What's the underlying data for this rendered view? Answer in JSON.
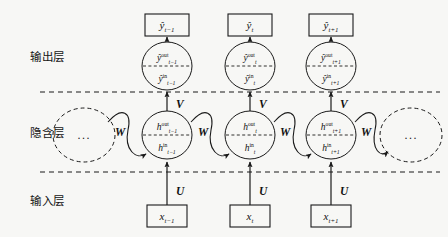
{
  "figure": {
    "type": "rnn-unfolded-architecture",
    "background": "#f7f7f5",
    "ink": "#1a1a1a"
  },
  "layers": [
    {
      "id": "output",
      "label": "输出层",
      "x": 30,
      "y": 48
    },
    {
      "id": "hidden",
      "label": "隐含层",
      "x": 30,
      "y": 124
    },
    {
      "id": "input",
      "label": "输入层",
      "x": 30,
      "y": 192
    }
  ],
  "dividers": [
    {
      "id": "output-hidden-divider",
      "y": 92,
      "x1": 40,
      "x2": 440
    },
    {
      "id": "hidden-input-divider",
      "y": 172,
      "x1": 40,
      "x2": 440
    }
  ],
  "timesteps": [
    {
      "id": "t-minus-1",
      "cx": 167,
      "output_box": {
        "base": "ŷ",
        "sub": "t−1"
      },
      "output_node": {
        "top": {
          "base": "ŷ",
          "sub": "t−1",
          "sup": "out"
        },
        "bottom": {
          "base": "ŷ",
          "sub": "t−1",
          "sup": "in"
        }
      },
      "hidden_node": {
        "top": {
          "base": "h",
          "sub": "t−1",
          "sup": "out"
        },
        "bottom": {
          "base": "h",
          "sub": "t−1",
          "sup": "in"
        }
      },
      "input_box": {
        "base": "x",
        "sub": "t−1"
      }
    },
    {
      "id": "t",
      "cx": 250,
      "output_box": {
        "base": "ŷ",
        "sub": "t"
      },
      "output_node": {
        "top": {
          "base": "ŷ",
          "sub": "t",
          "sup": "out"
        },
        "bottom": {
          "base": "ŷ",
          "sub": "t",
          "sup": "in"
        }
      },
      "hidden_node": {
        "top": {
          "base": "h",
          "sub": "t",
          "sup": "out"
        },
        "bottom": {
          "base": "h",
          "sub": "t",
          "sup": "in"
        }
      },
      "input_box": {
        "base": "x",
        "sub": "t"
      }
    },
    {
      "id": "t-plus-1",
      "cx": 331,
      "output_box": {
        "base": "ŷ",
        "sub": "t+1"
      },
      "output_node": {
        "top": {
          "base": "ŷ",
          "sub": "t+1",
          "sup": "out"
        },
        "bottom": {
          "base": "ŷ",
          "sub": "t+1",
          "sup": "in"
        }
      },
      "hidden_node": {
        "top": {
          "base": "h",
          "sub": "t+1",
          "sup": "out"
        },
        "bottom": {
          "base": "h",
          "sub": "t+1",
          "sup": "in"
        }
      },
      "input_box": {
        "base": "x",
        "sub": "t+1"
      }
    }
  ],
  "weights": {
    "input_to_hidden": "U",
    "hidden_to_output": "V",
    "hidden_recurrent": "W"
  },
  "weight_labels": [
    {
      "id": "v-t-minus-1",
      "text": "V",
      "x": 176,
      "y": 108
    },
    {
      "id": "v-t",
      "text": "V",
      "x": 259,
      "y": 108
    },
    {
      "id": "v-t-plus-1",
      "text": "V",
      "x": 340,
      "y": 108
    },
    {
      "id": "u-t-minus-1",
      "text": "U",
      "x": 176,
      "y": 195
    },
    {
      "id": "u-t",
      "text": "U",
      "x": 259,
      "y": 195
    },
    {
      "id": "u-t-plus-1",
      "text": "U",
      "x": 340,
      "y": 195
    },
    {
      "id": "w-left",
      "text": "W",
      "x": 115,
      "y": 136
    },
    {
      "id": "w-1",
      "text": "W",
      "x": 198,
      "y": 136
    },
    {
      "id": "w-2",
      "text": "W",
      "x": 280,
      "y": 136
    },
    {
      "id": "w-right",
      "text": "W",
      "x": 361,
      "y": 136
    }
  ],
  "ellipsis_nodes": [
    {
      "id": "ellipsis-left",
      "cx": 84,
      "cy": 135,
      "text": "..."
    },
    {
      "id": "ellipsis-right",
      "cx": 411,
      "cy": 135,
      "text": "..."
    }
  ],
  "geometry": {
    "output_box_y": 14,
    "output_box_w": 44,
    "output_box_h": 22,
    "output_node_cy": 66,
    "node_rx": 25,
    "node_ry": 24,
    "hidden_node_cy": 135,
    "input_box_y": 205,
    "input_box_w": 40,
    "input_box_h": 22
  }
}
